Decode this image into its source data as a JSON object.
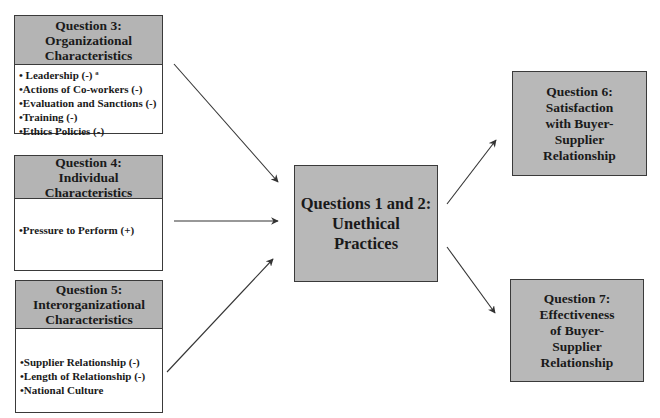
{
  "question3": {
    "title_lines": [
      "Question 3:",
      "Organizational",
      "Characteristics"
    ],
    "items": [
      "• Leadership (-) ª",
      "•Actions of Co-workers (-)",
      "•Evaluation and Sanctions (-)",
      "•Training (-)",
      "•Ethics Policies (-)"
    ]
  },
  "question4": {
    "title_lines": [
      "Question 4:",
      "Individual",
      "Characteristics"
    ],
    "items": [
      "•Pressure to Perform (+)"
    ]
  },
  "question5": {
    "title_lines": [
      "Question 5:",
      "Interorganizational",
      "Characteristics"
    ],
    "items": [
      "•Supplier Relationship (-)",
      "•Length of Relationship (-)",
      "•National Culture"
    ]
  },
  "center": {
    "title_lines": [
      "Questions 1 and 2:",
      "Unethical",
      "Practices"
    ]
  },
  "question6": {
    "title_lines": [
      "Question 6:",
      "Satisfaction",
      "with Buyer-",
      "Supplier",
      "Relationship"
    ]
  },
  "question7": {
    "title_lines": [
      "Question 7:",
      "Effectiveness",
      "of Buyer-",
      "Supplier",
      "Relationship"
    ]
  },
  "colors": {
    "header_fill": "#b4b4b4",
    "box_fill": "#b8b8b8",
    "border": "#3a3a3a",
    "arrow": "#333333"
  }
}
